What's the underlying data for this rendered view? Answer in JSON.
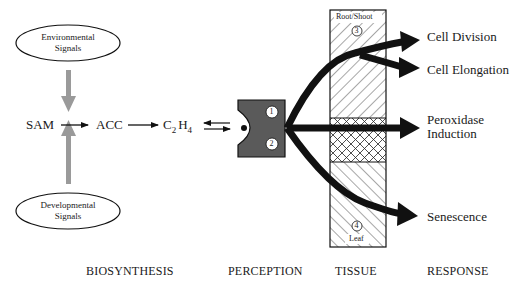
{
  "diagram": {
    "signals": {
      "environmental": "Environmental\nSignals",
      "environmental_line1": "Environmental",
      "environmental_line2": "Signals",
      "developmental_line1": "Developmental",
      "developmental_line2": "Signals"
    },
    "pathway": {
      "sam": "SAM",
      "acc": "ACC",
      "ethylene_c": "C",
      "ethylene_c_sub": "2",
      "ethylene_h": "H",
      "ethylene_h_sub": "4"
    },
    "receptor": {
      "site1": "1",
      "site2": "2"
    },
    "tissue": {
      "top_label": "Root/Shoot",
      "top_number": "3",
      "bottom_number": "4",
      "bottom_label": "Leaf"
    },
    "responses": {
      "cell_division": "Cell Division",
      "cell_elongation": "Cell Elongation",
      "peroxidase_line1": "Peroxidase",
      "peroxidase_line2": "Induction",
      "senescence": "Senescence"
    },
    "column_headings": {
      "biosynthesis": "BIOSYNTHESIS",
      "perception": "PERCEPTION",
      "tissue": "TISSUE",
      "response": "RESPONSE"
    },
    "colors": {
      "receptor_fill": "#5a5a5a",
      "signal_arrow": "#9a9a9a",
      "stroke": "#111111"
    }
  }
}
